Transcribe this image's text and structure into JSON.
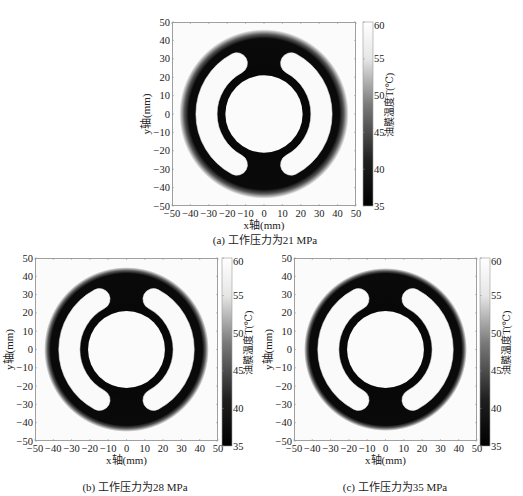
{
  "chart_data": [
    {
      "type": "heatmap",
      "id": "a",
      "title": "(a) 工作压力为21 MPa",
      "xlabel": "x轴(mm)",
      "ylabel": "y轴(mm)",
      "xlim": [
        -50,
        50
      ],
      "ylim": [
        -50,
        50
      ],
      "xticks": [
        -50,
        -40,
        -30,
        -20,
        -10,
        0,
        10,
        20,
        30,
        40,
        50
      ],
      "yticks": [
        -50,
        -40,
        -30,
        -20,
        -10,
        0,
        10,
        20,
        30,
        40,
        50
      ],
      "colorbar": {
        "label": "油膜温度T(℃)",
        "range": [
          35,
          60
        ],
        "ticks": [
          35,
          40,
          45,
          50,
          55,
          60
        ],
        "colormap": "gray"
      },
      "geometry": {
        "outer_radius_mm": 46,
        "dark_core_radius_mm": 41,
        "pocket_outer_radius_mm": 37,
        "pocket_inner_radius_mm": 25.5,
        "ring_outer_radius_mm": 24.5,
        "ring_inner_radius_mm": 21,
        "pocket_gap_halfwidth_mm": 10,
        "edge_gradient_mm": 6
      },
      "frame": {
        "x": 172,
        "y": 22,
        "size": 184
      },
      "colorbar_box": {
        "x": 363,
        "y": 22,
        "w": 10,
        "h": 184
      }
    },
    {
      "type": "heatmap",
      "id": "b",
      "title": "(b) 工作压力为28 MPa",
      "xlabel": "x轴(mm)",
      "ylabel": "y轴(mm)",
      "xlim": [
        -50,
        50
      ],
      "ylim": [
        -50,
        50
      ],
      "xticks": [
        -50,
        -40,
        -30,
        -20,
        -10,
        0,
        10,
        20,
        30,
        40,
        50
      ],
      "yticks": [
        -50,
        -40,
        -30,
        -20,
        -10,
        0,
        10,
        20,
        30,
        40,
        50
      ],
      "colorbar": {
        "label": "油膜温度T(℃)",
        "range": [
          35,
          60
        ],
        "ticks": [
          35,
          40,
          45,
          50,
          55,
          60
        ],
        "colormap": "gray"
      },
      "geometry": {
        "outer_radius_mm": 45,
        "dark_core_radius_mm": 41.5,
        "pocket_outer_radius_mm": 37,
        "pocket_inner_radius_mm": 25.5,
        "ring_outer_radius_mm": 24.5,
        "ring_inner_radius_mm": 21,
        "pocket_gap_halfwidth_mm": 10,
        "edge_gradient_mm": 4
      },
      "frame": {
        "x": 35,
        "y": 258,
        "size": 183
      },
      "colorbar_box": {
        "x": 222,
        "y": 258,
        "w": 10,
        "h": 188
      }
    },
    {
      "type": "heatmap",
      "id": "c",
      "title": "(c) 工作压力为35 MPa",
      "xlabel": "x轴(mm)",
      "ylabel": "y轴(mm)",
      "xlim": [
        -50,
        50
      ],
      "ylim": [
        -50,
        50
      ],
      "xticks": [
        -50,
        -40,
        -30,
        -20,
        -10,
        0,
        10,
        20,
        30,
        40,
        50
      ],
      "yticks": [
        -50,
        -40,
        -30,
        -20,
        -10,
        0,
        10,
        20,
        30,
        40,
        50
      ],
      "colorbar": {
        "label": "油膜温度T(℃)",
        "range": [
          35,
          60
        ],
        "ticks": [
          35,
          40,
          45,
          50,
          55,
          60
        ],
        "colormap": "gray"
      },
      "geometry": {
        "outer_radius_mm": 44.5,
        "dark_core_radius_mm": 41.5,
        "pocket_outer_radius_mm": 37,
        "pocket_inner_radius_mm": 25.5,
        "ring_outer_radius_mm": 24.5,
        "ring_inner_radius_mm": 21,
        "pocket_gap_halfwidth_mm": 10,
        "edge_gradient_mm": 3
      },
      "frame": {
        "x": 294,
        "y": 258,
        "size": 183
      },
      "colorbar_box": {
        "x": 480,
        "y": 258,
        "w": 10,
        "h": 188
      }
    }
  ],
  "captions": {
    "a": "(a) 工作压力为21 MPa",
    "b": "(b) 工作压力为28 MPa",
    "c": "(c) 工作压力为35 MPa"
  },
  "axis_labels": {
    "x": "x轴(mm)",
    "y": "y轴(mm)",
    "colorbar": "油膜温度T(℃)"
  }
}
